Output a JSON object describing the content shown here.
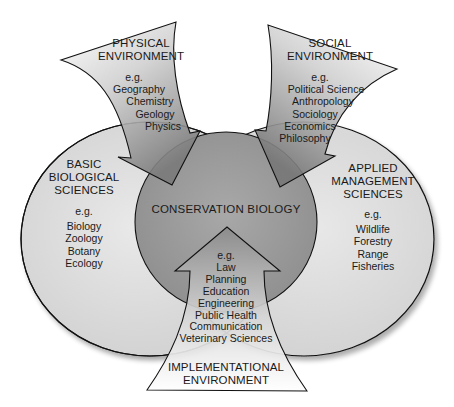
{
  "diagram": {
    "center": {
      "label": "CONSERVATION BIOLOGY"
    },
    "left_domain": {
      "title_lines": [
        "BASIC",
        "BIOLOGICAL",
        "SCIENCES"
      ],
      "eg": "e.g.",
      "items": [
        "Biology",
        "Zoology",
        "Botany",
        "Ecology"
      ]
    },
    "right_domain": {
      "title_lines": [
        "APPLIED",
        "MANAGEMENT",
        "SCIENCES"
      ],
      "eg": "e.g.",
      "items": [
        "Wildlife",
        "Forestry",
        "Range",
        "Fisheries"
      ]
    },
    "top_left_arrow": {
      "title_lines": [
        "PHYSICAL",
        "ENVIRONMENT"
      ],
      "eg": "e.g.",
      "items": [
        "Geography",
        "Chemistry",
        "Geology",
        "Physics"
      ]
    },
    "top_right_arrow": {
      "title_lines": [
        "SOCIAL",
        "ENVIRONMENT"
      ],
      "eg": "e.g.",
      "items": [
        "Political Science",
        "Anthropology",
        "Sociology",
        "Economics",
        "Philosophy"
      ]
    },
    "bottom_arrow": {
      "title_lines": [
        "IMPLEMENTATIONAL",
        "ENVIRONMENT"
      ],
      "eg": "e.g.",
      "items": [
        "Law",
        "Planning",
        "Education",
        "Engineering",
        "Public Health",
        "Communication",
        "Veterinary Sciences"
      ]
    },
    "colors": {
      "ellipse_fill": "#d9d9d9",
      "center_fill": "#9a9a9a",
      "arrow_fill_dark": "#8c8c8c",
      "outline": "#111111",
      "background": "#ffffff"
    }
  }
}
